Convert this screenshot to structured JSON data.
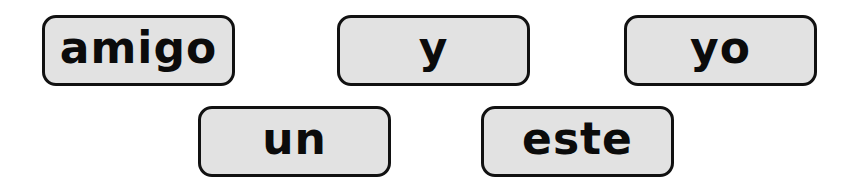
{
  "word_tiles": [
    {
      "label": "amigo",
      "x": 42,
      "y": 15
    },
    {
      "label": "y",
      "x": 337,
      "y": 15
    },
    {
      "label": "yo",
      "x": 624,
      "y": 15
    },
    {
      "label": "un",
      "x": 198,
      "y": 106
    },
    {
      "label": "este",
      "x": 481,
      "y": 106
    }
  ],
  "colors": {
    "tile_fill": "#e2e2e2",
    "tile_border": "#111111",
    "text": "#0b0b0b",
    "background": "#ffffff"
  }
}
